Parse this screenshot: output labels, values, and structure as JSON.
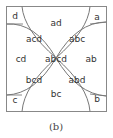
{
  "diagram": {
    "type": "venn-four-set",
    "caption": "(b)",
    "regions": [
      {
        "label": "d",
        "x": 15,
        "y": 16
      },
      {
        "label": "a",
        "x": 97,
        "y": 17
      },
      {
        "label": "ad",
        "x": 56,
        "y": 23
      },
      {
        "label": "acd",
        "x": 34,
        "y": 39
      },
      {
        "label": "abc",
        "x": 77,
        "y": 39
      },
      {
        "label": "cd",
        "x": 21,
        "y": 59
      },
      {
        "label": "abcd",
        "x": 56,
        "y": 59
      },
      {
        "label": "ab",
        "x": 91,
        "y": 59
      },
      {
        "label": "bcd",
        "x": 34,
        "y": 80
      },
      {
        "label": "abd",
        "x": 77,
        "y": 80
      },
      {
        "label": "bc",
        "x": 56,
        "y": 94
      },
      {
        "label": "c",
        "x": 15,
        "y": 100
      },
      {
        "label": "b",
        "x": 97,
        "y": 99
      }
    ],
    "colors": {
      "stroke": "#777777",
      "text": "#333333",
      "background": "#ffffff"
    }
  }
}
